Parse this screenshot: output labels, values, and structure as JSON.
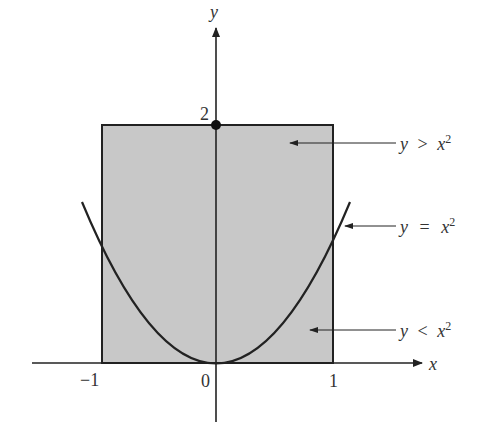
{
  "diagram": {
    "axes": {
      "x_label": "x",
      "y_label": "y",
      "x_ticks": [
        {
          "value": -1,
          "label": "−1"
        },
        {
          "value": 0,
          "label": "0"
        },
        {
          "value": 1,
          "label": "1"
        }
      ],
      "y_ticks": [
        {
          "value": 2,
          "label": "2"
        }
      ]
    },
    "region": {
      "shape": "rectangle",
      "x_range": [
        -1,
        1
      ],
      "y_range": [
        0,
        2
      ],
      "fill_color": "#c8c8c8"
    },
    "curve": {
      "equation": "y = x^2",
      "x_range": [
        -1.16,
        1.16
      ]
    },
    "point": {
      "x": 0,
      "y": 2
    },
    "annotations": [
      {
        "id": "above",
        "lhs": "y",
        "op": ">",
        "rhs": "x",
        "exp": "2"
      },
      {
        "id": "on",
        "lhs": "y",
        "op": "=",
        "rhs": "x",
        "exp": "2"
      },
      {
        "id": "below",
        "lhs": "y",
        "op": "<",
        "rhs": "x",
        "exp": "2"
      }
    ]
  }
}
